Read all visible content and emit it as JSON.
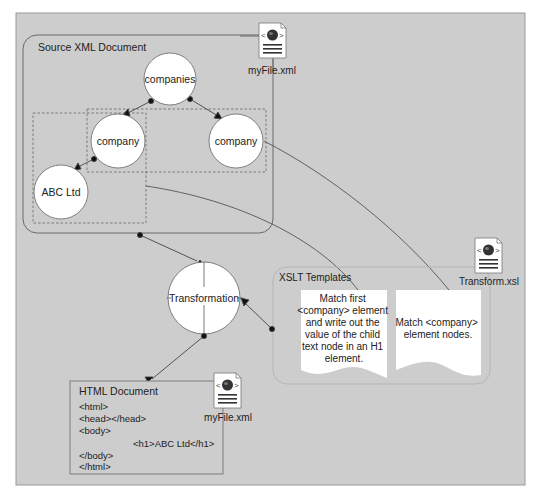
{
  "source_box": {
    "title": "Source XML Document",
    "file_label": "myFile.xml",
    "nodes": {
      "root": "companies",
      "child_left": "company",
      "child_right": "company",
      "leaf": "ABC Ltd"
    }
  },
  "transformation": {
    "label": "Transformation"
  },
  "xslt_box": {
    "title": "XSLT Templates",
    "file_label": "Transform.xsl",
    "templates": [
      {
        "lines": [
          "Match first",
          "<company> element",
          "and write out the",
          "value of the child",
          "text node in an H1",
          "element."
        ]
      },
      {
        "lines": [
          "Match <company>",
          "element nodes."
        ]
      }
    ]
  },
  "html_box": {
    "title": "HTML Document",
    "file_label": "myFile.xml",
    "code_lines": [
      "<html>",
      "<head></head>",
      "<body>",
      "<h1>ABC Ltd</h1>",
      "</body>",
      "</html>"
    ]
  },
  "colors": {
    "panel_bg": "#cdcdcd",
    "line": "#555555",
    "node_fill": "#ffffff"
  }
}
